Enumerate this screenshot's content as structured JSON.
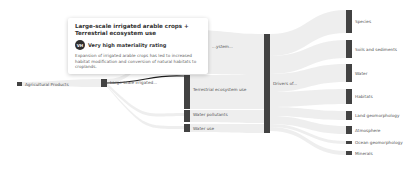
{
  "diagram": {
    "type": "sankey",
    "colors": {
      "node": "#424242",
      "link": "#eeeeee",
      "highlight_link": "#222222"
    },
    "columns": [
      {
        "nodes": [
          {
            "id": "agri",
            "label": "Agricultural Products"
          }
        ]
      },
      {
        "nodes": [
          {
            "id": "irrig",
            "label": "Large-scale irrigated..."
          }
        ]
      },
      {
        "nodes": [
          {
            "id": "freshwater",
            "label": "...ystem..."
          },
          {
            "id": "terrestrial",
            "label": "Terrestrial ecosystem use"
          },
          {
            "id": "pollutants",
            "label": "Water pollutants"
          },
          {
            "id": "wateruse",
            "label": "Water use"
          }
        ]
      },
      {
        "nodes": [
          {
            "id": "drivers",
            "label": "Drivers of..."
          }
        ]
      },
      {
        "nodes": [
          {
            "id": "species",
            "label": "Species"
          },
          {
            "id": "soils",
            "label": "Soils and sediments"
          },
          {
            "id": "water",
            "label": "Water"
          },
          {
            "id": "habitats",
            "label": "Habitats"
          },
          {
            "id": "landgeo",
            "label": "Land geomorphology"
          },
          {
            "id": "atmo",
            "label": "Atmosphere"
          },
          {
            "id": "oceangeo",
            "label": "Ocean geomorphology"
          },
          {
            "id": "minerals",
            "label": "Minerals"
          }
        ]
      }
    ]
  },
  "tooltip": {
    "title": "Large-scale irrigated arable crops + Terrestrial ecosystem use",
    "badge": "VH",
    "rating": "Very high materiality rating",
    "description": "Expansion of irrigated arable crops has led to increased habitat modification and conversion of natural habitats to croplands."
  }
}
